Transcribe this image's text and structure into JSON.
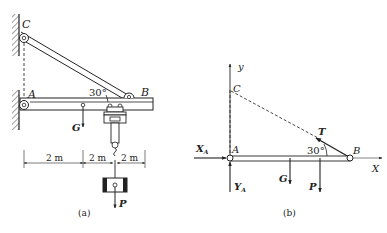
{
  "figure_a": {
    "caption": "(a)",
    "points": {
      "C": "C",
      "A": "A",
      "B": "B"
    },
    "angle": "30°",
    "forces": {
      "G": "G",
      "P": "P"
    },
    "dimensions": [
      "2 m",
      "2 m",
      "2 m"
    ]
  },
  "figure_b": {
    "caption": "(b)",
    "axes": {
      "y": "y",
      "x": "X"
    },
    "points": {
      "C": "C",
      "A": "A",
      "B": "B"
    },
    "angle": "30°",
    "forces": {
      "T": "T",
      "G": "G",
      "P": "P",
      "XA": "X",
      "XA_sub": "A",
      "YA": "Y",
      "YA_sub": "A"
    }
  },
  "colors": {
    "line": "#222222",
    "dash": "#333333",
    "background": "#ffffff"
  }
}
